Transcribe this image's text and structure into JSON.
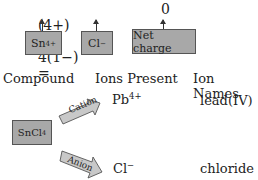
{
  "equation": {
    "sn_charge": "(4+)",
    "plus": "+",
    "cl_term": "4(1−)",
    "equals": "=",
    "net": "0"
  },
  "labels": {
    "sn_base": "Sn",
    "sn_sup": "4+",
    "cl_base": "Cl",
    "cl_sup": "−",
    "net_charge": "Net charge"
  },
  "table": {
    "headers": [
      "Compound",
      "Ions Present",
      "Ion Names"
    ],
    "compound_base": "SnCl",
    "compound_sub": "4",
    "cation_label": "Cation",
    "anion_label": "Anion",
    "cation_base": "Pb",
    "cation_sup": "4+",
    "cation_name": "lead(IV)",
    "anion_base": "Cl",
    "anion_sup": "−",
    "anion_name": "chloride"
  },
  "colors": {
    "box_fill": "#a8a8a8",
    "arrow_fill": "#c8c8c8"
  }
}
